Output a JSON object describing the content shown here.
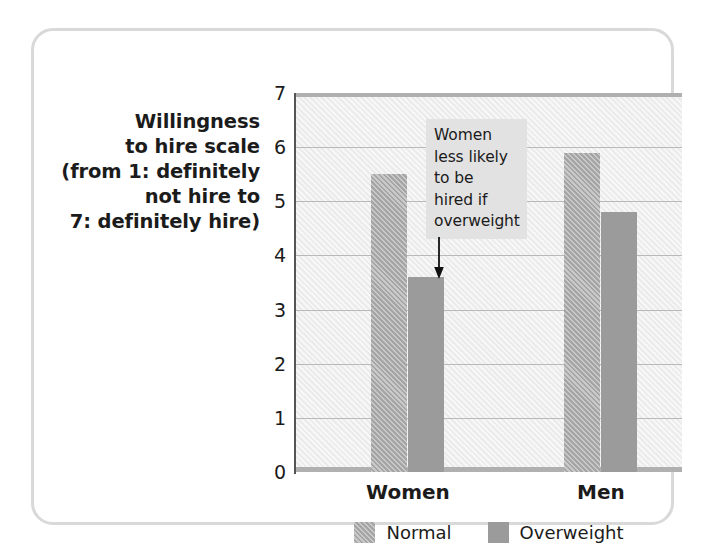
{
  "chart_data": {
    "type": "bar",
    "title": "",
    "xlabel": "",
    "ylabel": "Willingness to hire scale (from 1: definitely not hire to 7: definitely hire)",
    "ylabel_lines": "Willingness\nto hire scale\n(from 1: definitely\nnot hire to\n7: definitely hire)",
    "categories": [
      "Women",
      "Men"
    ],
    "series": [
      {
        "name": "Normal",
        "values": [
          5.5,
          5.9
        ],
        "color": "#a5a5a5",
        "pattern": "diagonal-hatch"
      },
      {
        "name": "Overweight",
        "values": [
          3.6,
          4.8
        ],
        "color": "#9b9b9b",
        "pattern": "solid"
      }
    ],
    "ylim": [
      0,
      7
    ],
    "y_ticks": [
      0,
      1,
      2,
      3,
      4,
      5,
      6,
      7
    ],
    "y_tick_labels": [
      "0",
      "1",
      "2",
      "3",
      "4",
      "5",
      "6",
      "7"
    ],
    "grid": true,
    "grid_axis": "y",
    "legend_position": "bottom-center",
    "annotations": [
      {
        "text": "Women less likely to be hired if overweight",
        "text_lines": "Women\nless likely\nto be\nhired if\noverweight",
        "points_to_series": "Overweight",
        "points_to_category": "Women",
        "arrow": "down-arrow-icon"
      }
    ],
    "plot_background": "#eeeeee",
    "annotation_background": "#e2e2e2",
    "frame_border_color": "#d9d9d9"
  },
  "legend": {
    "items": [
      {
        "label": "Normal",
        "swatch": "normal-swatch-icon"
      },
      {
        "label": "Overweight",
        "swatch": "overweight-swatch-icon"
      }
    ]
  }
}
